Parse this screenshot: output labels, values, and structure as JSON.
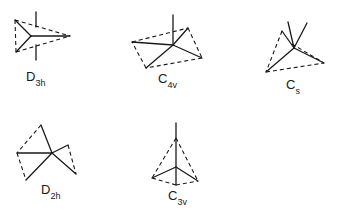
{
  "figures": [
    {
      "id": "d3h",
      "label": "D",
      "subscript": "3h"
    },
    {
      "id": "c4v",
      "label": "C",
      "subscript": "4v"
    },
    {
      "id": "cs",
      "label": "C",
      "subscript": "s"
    },
    {
      "id": "d2h",
      "label": "D",
      "subscript": "2h"
    },
    {
      "id": "c3v",
      "label": "C",
      "subscript": "3v"
    }
  ]
}
